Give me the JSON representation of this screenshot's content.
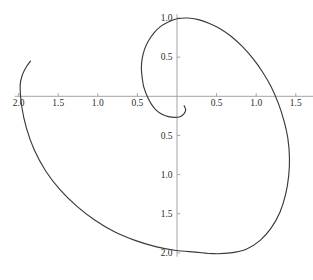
{
  "figure": {
    "background_color": "#ffffff",
    "curve_color": "#3a3a3a",
    "axis_color": "#9a9a9a",
    "tick_color": "#9a9a9a",
    "label_color": "#2b2b2b"
  },
  "chart_data": {
    "type": "line",
    "title": "",
    "subtitle": "",
    "xlabel": "",
    "ylabel": "",
    "grid": false,
    "legend": null,
    "annotations": [],
    "xlim": [
      -2.05,
      1.72
    ],
    "ylim": [
      -2.05,
      1.05
    ],
    "axis_origin": [
      0,
      0
    ],
    "x_ticks": [
      -2.0,
      -1.5,
      -1.0,
      -0.5,
      0.5,
      1.0,
      1.5
    ],
    "x_tick_labels": [
      "2.0",
      "1.5",
      "1.0",
      "0.5",
      "0.5",
      "1.0",
      "1.5"
    ],
    "y_ticks": [
      1.0,
      0.5,
      -0.5,
      -1.0,
      -1.5,
      -2.0
    ],
    "y_tick_labels": [
      "1.0",
      "0.5",
      "0.5",
      "1.0",
      "1.5",
      "2.0"
    ],
    "curve_name": "spiral",
    "curve_description": "outward spiral, parametric polar r increasing with angle",
    "points": [
      [
        0.09,
        -0.12
      ],
      [
        0.11,
        -0.17
      ],
      [
        0.09,
        -0.22
      ],
      [
        0.04,
        -0.26
      ],
      [
        -0.03,
        -0.27
      ],
      [
        -0.11,
        -0.26
      ],
      [
        -0.19,
        -0.23
      ],
      [
        -0.27,
        -0.17
      ],
      [
        -0.33,
        -0.09
      ],
      [
        -0.38,
        0.01
      ],
      [
        -0.42,
        0.12
      ],
      [
        -0.44,
        0.24
      ],
      [
        -0.45,
        0.36
      ],
      [
        -0.44,
        0.48
      ],
      [
        -0.41,
        0.6
      ],
      [
        -0.36,
        0.71
      ],
      [
        -0.29,
        0.81
      ],
      [
        -0.21,
        0.89
      ],
      [
        -0.11,
        0.95
      ],
      [
        0.0,
        0.99
      ],
      [
        0.13,
        1.0
      ],
      [
        0.27,
        0.98
      ],
      [
        0.41,
        0.93
      ],
      [
        0.55,
        0.86
      ],
      [
        0.69,
        0.76
      ],
      [
        0.83,
        0.63
      ],
      [
        0.96,
        0.48
      ],
      [
        1.08,
        0.31
      ],
      [
        1.19,
        0.12
      ],
      [
        1.28,
        -0.09
      ],
      [
        1.35,
        -0.31
      ],
      [
        1.4,
        -0.54
      ],
      [
        1.42,
        -0.78
      ],
      [
        1.41,
        -1.02
      ],
      [
        1.37,
        -1.26
      ],
      [
        1.3,
        -1.48
      ],
      [
        1.19,
        -1.68
      ],
      [
        1.05,
        -1.84
      ],
      [
        0.88,
        -1.95
      ],
      [
        0.68,
        -2.0
      ],
      [
        0.46,
        -2.01
      ],
      [
        0.23,
        -1.99
      ],
      [
        -0.01,
        -1.97
      ],
      [
        -0.27,
        -1.92
      ],
      [
        -0.53,
        -1.84
      ],
      [
        -0.79,
        -1.73
      ],
      [
        -1.04,
        -1.58
      ],
      [
        -1.27,
        -1.4
      ],
      [
        -1.48,
        -1.19
      ],
      [
        -1.66,
        -0.95
      ],
      [
        -1.8,
        -0.69
      ],
      [
        -1.9,
        -0.41
      ],
      [
        -1.96,
        -0.13
      ],
      [
        -1.98,
        0.14
      ],
      [
        -1.95,
        0.28
      ],
      [
        -1.9,
        0.38
      ],
      [
        -1.85,
        0.45
      ]
    ]
  }
}
